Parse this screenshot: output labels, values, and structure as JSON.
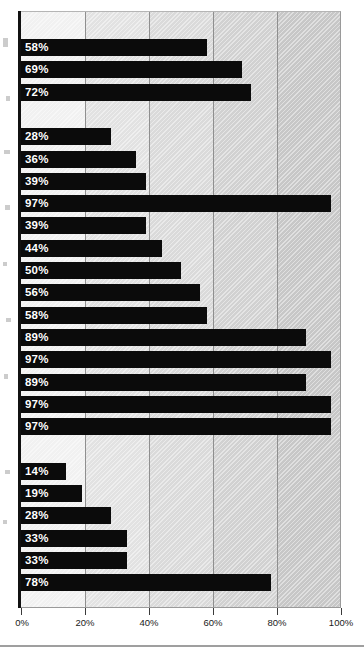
{
  "chart_data": {
    "type": "bar",
    "orientation": "horizontal",
    "title": "",
    "subtitle": "",
    "xlabel": "",
    "ylabel": "",
    "xlim": [
      0,
      100
    ],
    "xtick_labels": [
      "0%",
      "20%",
      "40%",
      "60%",
      "80%",
      "100%"
    ],
    "xticks": [
      0,
      20,
      40,
      60,
      80,
      100
    ],
    "grid": true,
    "legend": "none",
    "value_suffix": "%",
    "bar_color": "#0b0b0b",
    "label_color": "#ffffff",
    "band_colors": [
      "#f1f1f1",
      "#e2e2e2",
      "#dadada",
      "#d1d1d1",
      "#c7c7c7"
    ],
    "groups": [
      {
        "name": "group-1",
        "bars": [
          {
            "label": "58%",
            "value": 58
          },
          {
            "label": "69%",
            "value": 69
          },
          {
            "label": "72%",
            "value": 72
          }
        ]
      },
      {
        "name": "group-2",
        "bars": [
          {
            "label": "28%",
            "value": 28
          },
          {
            "label": "36%",
            "value": 36
          },
          {
            "label": "39%",
            "value": 39
          },
          {
            "label": "97%",
            "value": 97
          },
          {
            "label": "39%",
            "value": 39
          },
          {
            "label": "44%",
            "value": 44
          },
          {
            "label": "50%",
            "value": 50
          },
          {
            "label": "56%",
            "value": 56
          },
          {
            "label": "58%",
            "value": 58
          },
          {
            "label": "89%",
            "value": 89
          },
          {
            "label": "97%",
            "value": 97
          },
          {
            "label": "89%",
            "value": 89
          },
          {
            "label": "97%",
            "value": 97
          },
          {
            "label": "97%",
            "value": 97
          }
        ]
      },
      {
        "name": "group-3",
        "bars": [
          {
            "label": "14%",
            "value": 14
          },
          {
            "label": "19%",
            "value": 19
          },
          {
            "label": "28%",
            "value": 28
          },
          {
            "label": "33%",
            "value": 33
          },
          {
            "label": "33%",
            "value": 33
          },
          {
            "label": "78%",
            "value": 78
          }
        ]
      }
    ],
    "values_flat": [
      58,
      69,
      72,
      28,
      36,
      39,
      97,
      39,
      44,
      50,
      56,
      58,
      89,
      97,
      89,
      97,
      97,
      14,
      19,
      28,
      33,
      33,
      78
    ]
  }
}
